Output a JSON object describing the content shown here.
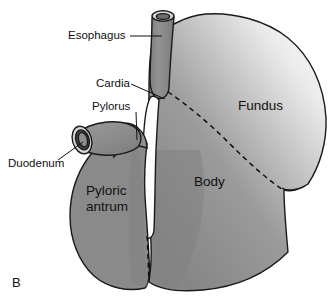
{
  "figure": {
    "panel_label": "B"
  },
  "annotations": [
    {
      "id": "esophagus",
      "label": "Esophagus",
      "text_x": 68,
      "text_y": 39
    },
    {
      "id": "cardia",
      "label": "Cardia",
      "text_x": 96,
      "text_y": 87
    },
    {
      "id": "pylorus",
      "label": "Pylorus",
      "text_x": 92,
      "text_y": 110
    },
    {
      "id": "duodenum",
      "label": "Duodenum",
      "text_x": 8,
      "text_y": 167
    }
  ],
  "regions": [
    {
      "id": "fundus",
      "label": "Fundus",
      "text_x": 238,
      "text_y": 110
    },
    {
      "id": "body",
      "label": "Body",
      "text_x": 194,
      "text_y": 186
    },
    {
      "id": "pyloric-antrum",
      "label_line1": "Pyloric",
      "label_line2": "antrum",
      "text_x": 86,
      "text_y": 195
    }
  ],
  "colors": {
    "background": "#ffffff",
    "organ_fill": "#8a8a8a",
    "fundus_highlight": "#f2f2f2",
    "fundus_mid": "#a8a8a8",
    "outline": "#1a1a1a",
    "lumen_white": "#fdfdfd",
    "tube_fill": "#8f8f8f",
    "tube_rim_light": "#d8d8d8",
    "tube_lumen_dark": "#6f6f6f",
    "text": "#101010",
    "dash": "#101010"
  }
}
